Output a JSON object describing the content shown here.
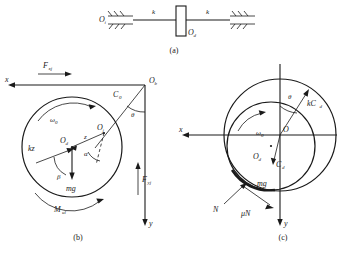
{
  "figure": {
    "caption_bottom": "",
    "subfigures": [
      {
        "id": "a",
        "label": "(a)",
        "title": "spring-supported rotor schematic"
      },
      {
        "id": "b",
        "label": "(b)",
        "title": "rotor free-body diagram"
      },
      {
        "id": "c",
        "label": "(c)",
        "title": "rotor-stator contact diagram"
      }
    ]
  },
  "panel_a": {
    "label": "(a)",
    "left_support": "O",
    "left_support_sub": "i",
    "spring_left": "k",
    "spring_right": "k",
    "block_label": "O",
    "block_label_sub": "d",
    "hatch_left": "ground-hatching",
    "hatch_right": "ground-hatching"
  },
  "panel_b": {
    "label": "(b)",
    "axis_x": "x",
    "axis_y": "y",
    "origin": "O",
    "origin_sub": "b",
    "force_fx": "F",
    "force_fx_sub": "xj",
    "force_fy": "F",
    "force_fy_sub": "yj",
    "spring_force": "kz",
    "weight": "mg",
    "moment": "M",
    "moment_sub": "ul",
    "omega": "ω",
    "omega_sub": "0",
    "center_disc": "O",
    "center_disc_sub": "d",
    "center_journal": "O",
    "center_journal_sub": "j",
    "eccentricity": "z",
    "clearance": "C",
    "clearance_sub": "0",
    "angle_theta": "θ",
    "angle_alpha": "α",
    "angle_beta": "β"
  },
  "panel_c": {
    "label": "(c)",
    "axis_x": "x",
    "axis_y": "y",
    "origin": "O",
    "center_disc": "O",
    "center_disc_sub": "d",
    "contact_vector": "C",
    "contact_vector_sub": "d",
    "spring_force": "kC",
    "spring_force_sub": "d",
    "weight": "mg",
    "normal_force": "N",
    "friction_force": "μN",
    "omega": "ω",
    "omega_sub": "0",
    "angle_theta": "θ"
  },
  "colors": {
    "ink": "#1a1a1a",
    "paper": "#ffffff"
  }
}
